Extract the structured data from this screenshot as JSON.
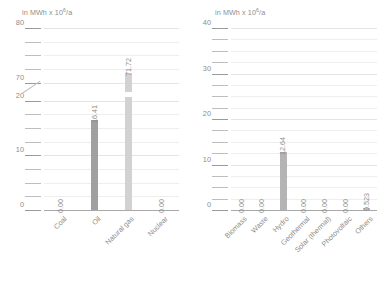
{
  "chart_data": [
    {
      "type": "bar",
      "panel": "left",
      "title": "",
      "axis_caption": "in MWh x 10",
      "axis_caption_exp": "6",
      "axis_caption_suffix": "/a",
      "ylabel": "",
      "xlabel": "",
      "grid": true,
      "legend": "none",
      "axis_broken": true,
      "break_low": 20,
      "break_high": 70,
      "ylim": [
        0,
        80
      ],
      "ytick_labels": [
        "80",
        "70",
        "20",
        "10",
        "0"
      ],
      "ytick_values": [
        80,
        70,
        20,
        10,
        0
      ],
      "minor_tick_step": 2.5,
      "categories": [
        "Coal",
        "Oil",
        "Natural gas",
        "Nuclear"
      ],
      "values": [
        0.0,
        16.41,
        71.72,
        0.0
      ],
      "value_labels": [
        "0.00",
        "16.41",
        "71.72",
        "0.00"
      ],
      "bar_colors": [
        "#bdbdbd",
        "#a0a0a0",
        "#d2d2d2",
        "#bdbdbd"
      ]
    },
    {
      "type": "bar",
      "panel": "right",
      "title": "",
      "axis_caption": "in MWh x 10",
      "axis_caption_exp": "6",
      "axis_caption_suffix": "/a",
      "ylabel": "",
      "xlabel": "",
      "grid": true,
      "legend": "none",
      "axis_broken": false,
      "ylim": [
        0,
        40
      ],
      "ytick_labels": [
        "40",
        "30",
        "20",
        "10",
        "0"
      ],
      "ytick_values": [
        40,
        30,
        20,
        10,
        0
      ],
      "minor_tick_step": 2.5,
      "categories": [
        "Biomass",
        "Waste",
        "Hydro",
        "Geothermal",
        "Solar (thermal)",
        "Photovoltaic",
        "Others"
      ],
      "values": [
        0.0,
        0.0,
        12.64,
        0.0,
        0.0,
        0.0,
        0.523
      ],
      "value_labels": [
        "0.00",
        "0.00",
        "12.64",
        "0.00",
        "0.00",
        "0.00",
        "0.523"
      ],
      "bar_colors": [
        "#bdbdbd",
        "#bdbdbd",
        "#b4b4b4",
        "#bdbdbd",
        "#bdbdbd",
        "#bdbdbd",
        "#bdbdbd"
      ]
    }
  ],
  "colors": {
    "gridline": "#eeeeee",
    "gridline_major": "#e4e4e4",
    "baseline": "#a8a8a8",
    "text": "#8d8d8d",
    "bar_dark": "#a0a0a0",
    "bar_light": "#d2d2d2"
  }
}
